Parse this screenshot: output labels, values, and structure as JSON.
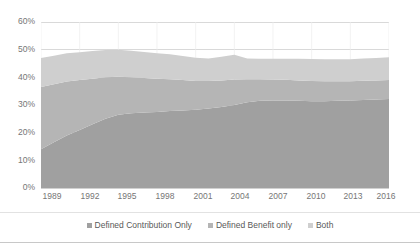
{
  "chart_data": {
    "type": "area",
    "stacked": true,
    "title": "",
    "subtitle": "",
    "xlabel": "",
    "ylabel": "",
    "ylim": [
      0,
      60
    ],
    "ytick_values": [
      0,
      10,
      20,
      30,
      40,
      50,
      60
    ],
    "ytick_labels": [
      "0%",
      "10%",
      "20%",
      "30%",
      "40%",
      "50%",
      "60%"
    ],
    "grid": true,
    "grid_axis": "y",
    "legend_position": "bottom",
    "x": [
      1989,
      1990,
      1991,
      1992,
      1993,
      1994,
      1995,
      1996,
      1997,
      1998,
      1999,
      2000,
      2001,
      2002,
      2003,
      2004,
      2005,
      2006,
      2007,
      2008,
      2009,
      2010,
      2011,
      2012,
      2013,
      2014,
      2015,
      2016
    ],
    "xtick_values": [
      1989,
      1992,
      1995,
      1998,
      2001,
      2004,
      2007,
      2010,
      2013,
      2016
    ],
    "xtick_labels": [
      "1989",
      "1992",
      "1995",
      "1998",
      "2001",
      "2004",
      "2007",
      "2010",
      "2013",
      "2016"
    ],
    "series": [
      {
        "name": "Defined Contribution Only",
        "color": "#a0a0a0",
        "values": [
          14.0,
          16.5,
          19.0,
          21.0,
          23.0,
          25.0,
          26.5,
          27.0,
          27.3,
          27.5,
          27.8,
          28.0,
          28.3,
          28.7,
          29.3,
          30.0,
          31.0,
          31.5,
          31.6,
          31.6,
          31.5,
          31.4,
          31.4,
          31.5,
          31.6,
          31.8,
          32.0,
          32.2
        ]
      },
      {
        "name": "Defined Benefit only",
        "color": "#b5b5b5",
        "values": [
          22.5,
          21.0,
          19.5,
          18.0,
          16.5,
          15.0,
          13.7,
          13.0,
          12.5,
          12.0,
          11.5,
          11.0,
          10.4,
          10.0,
          9.6,
          9.2,
          8.3,
          7.8,
          7.6,
          7.5,
          7.4,
          7.3,
          7.2,
          7.1,
          7.0,
          7.0,
          6.9,
          6.8
        ]
      },
      {
        "name": "Both",
        "color": "#cfcfcf",
        "values": [
          10.5,
          10.3,
          10.2,
          10.1,
          10.0,
          9.9,
          9.8,
          9.6,
          9.4,
          9.2,
          9.0,
          8.7,
          8.4,
          8.1,
          8.5,
          9.0,
          7.5,
          7.4,
          7.5,
          7.6,
          7.8,
          7.9,
          7.9,
          7.9,
          7.9,
          8.0,
          8.1,
          8.3
        ]
      }
    ]
  },
  "legend": {
    "items": [
      {
        "label": "Defined Contribution Only",
        "color": "#a0a0a0"
      },
      {
        "label": "Defined Benefit only",
        "color": "#b5b5b5"
      },
      {
        "label": "Both",
        "color": "#cfcfcf"
      }
    ]
  },
  "colors": {
    "defined_contribution_only": "#a0a0a0",
    "defined_benefit_only": "#b5b5b5",
    "both": "#cfcfcf",
    "gridline": "#d9d9d9",
    "axis_line": "#d0d0d0",
    "tick_text": "#767676",
    "legend_text": "#595959",
    "background": "#ffffff"
  }
}
